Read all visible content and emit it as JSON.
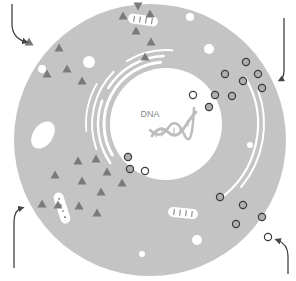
{
  "diagram": {
    "type": "cell-diagram",
    "colors": {
      "background": "#ffffff",
      "cytoplasm": "#c4c4c4",
      "nucleus": "#ffffff",
      "membrane_lines": "#ffffff",
      "protein": "#7a7a7a",
      "vesicle_fill": "#b0b0b0",
      "vesicle_stroke": "#3a3a3a",
      "arrow": "#444444",
      "helix": "#bdbdbd",
      "label": "#8a8a8a"
    },
    "cell": {
      "cx": 150,
      "cy": 140,
      "r": 136
    },
    "nucleus": {
      "cx": 166,
      "cy": 124,
      "r": 56,
      "label": "DNA",
      "label_x": 150,
      "label_y": 117
    },
    "vacuoles": [
      {
        "cx": 43,
        "cy": 135,
        "rx": 10,
        "ry": 15,
        "rotate": 35
      },
      {
        "cx": 89,
        "cy": 62,
        "r": 6
      },
      {
        "cx": 42,
        "cy": 69,
        "r": 4
      },
      {
        "cx": 190,
        "cy": 17,
        "r": 4
      },
      {
        "cx": 209,
        "cy": 49,
        "r": 5
      },
      {
        "cx": 197,
        "cy": 240,
        "r": 5
      },
      {
        "cx": 142,
        "cy": 254,
        "r": 3
      },
      {
        "cx": 250,
        "cy": 145,
        "r": 3
      }
    ],
    "mitochondria": [
      {
        "x": 128,
        "y": 15,
        "w": 30,
        "h": 10,
        "rotate": 8
      },
      {
        "x": 168,
        "y": 208,
        "w": 30,
        "h": 10,
        "rotate": 6
      },
      {
        "x": 57,
        "y": 192,
        "w": 10,
        "h": 32,
        "rotate": -18
      }
    ],
    "proteins": [
      {
        "x": 138,
        "y": 6,
        "rot": 180
      },
      {
        "x": 123,
        "y": 16,
        "rot": 0
      },
      {
        "x": 150,
        "y": 14,
        "rot": 0
      },
      {
        "x": 136,
        "y": 31,
        "rot": 0
      },
      {
        "x": 151,
        "y": 42,
        "rot": 0
      },
      {
        "x": 145,
        "y": 57,
        "rot": 0
      },
      {
        "x": 29,
        "y": 42,
        "rot": 0
      },
      {
        "x": 59,
        "y": 48,
        "rot": 0
      },
      {
        "x": 67,
        "y": 69,
        "rot": 0
      },
      {
        "x": 47,
        "y": 74,
        "rot": 0
      },
      {
        "x": 82,
        "y": 81,
        "rot": 0
      },
      {
        "x": 78,
        "y": 161,
        "rot": 0
      },
      {
        "x": 96,
        "y": 159,
        "rot": 0
      },
      {
        "x": 55,
        "y": 175,
        "rot": 0
      },
      {
        "x": 82,
        "y": 181,
        "rot": 0
      },
      {
        "x": 107,
        "y": 172,
        "rot": 0
      },
      {
        "x": 122,
        "y": 183,
        "rot": 0
      },
      {
        "x": 101,
        "y": 192,
        "rot": 0
      },
      {
        "x": 42,
        "y": 204,
        "rot": 0
      },
      {
        "x": 58,
        "y": 205,
        "rot": 0
      },
      {
        "x": 79,
        "y": 206,
        "rot": 0
      },
      {
        "x": 97,
        "y": 213,
        "rot": 0
      }
    ],
    "vesicles": [
      {
        "cx": 246,
        "cy": 62,
        "filled": true
      },
      {
        "cx": 258,
        "cy": 74,
        "filled": true
      },
      {
        "cx": 243,
        "cy": 81,
        "filled": true
      },
      {
        "cx": 225,
        "cy": 74,
        "filled": true
      },
      {
        "cx": 262,
        "cy": 88,
        "filled": true
      },
      {
        "cx": 232,
        "cy": 96,
        "filled": true
      },
      {
        "cx": 215,
        "cy": 95,
        "filled": true
      },
      {
        "cx": 193,
        "cy": 95,
        "filled": false
      },
      {
        "cx": 209,
        "cy": 107,
        "filled": true
      },
      {
        "cx": 128,
        "cy": 157,
        "filled": true
      },
      {
        "cx": 130,
        "cy": 169,
        "filled": true
      },
      {
        "cx": 145,
        "cy": 171,
        "filled": false
      },
      {
        "cx": 220,
        "cy": 197,
        "filled": true
      },
      {
        "cx": 243,
        "cy": 205,
        "filled": true
      },
      {
        "cx": 236,
        "cy": 224,
        "filled": true
      },
      {
        "cx": 262,
        "cy": 217,
        "filled": true
      },
      {
        "cx": 268,
        "cy": 237,
        "filled": false
      }
    ],
    "arrows": [
      {
        "name": "entry-arrow-top-left",
        "d": "M12 4 L12 24 Q12 38 26 42"
      },
      {
        "name": "exit-arrow-top-right",
        "d": "M284 18 L284 70 Q284 78 280 80"
      },
      {
        "name": "entry-arrow-bottom-left",
        "d": "M14 268 L14 222 Q14 210 22 208"
      },
      {
        "name": "exit-arrow-bottom-right",
        "d": "M288 274 L288 256 Q288 244 277 240"
      }
    ]
  }
}
